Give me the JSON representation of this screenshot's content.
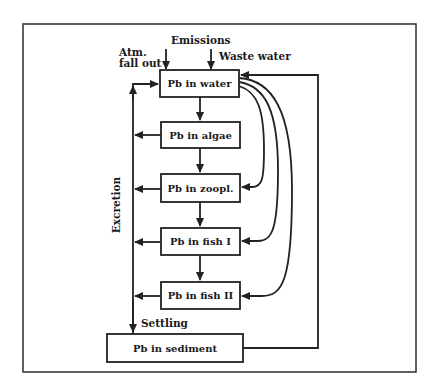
{
  "diagram": {
    "title": "",
    "nodes": {
      "water": "Pb in water",
      "algae": "Pb in algae",
      "zoopl": "Pb in zoopl.",
      "fish1": "Pb in fish I",
      "fish2": "Pb in fish II",
      "sediment": "Pb in sediment"
    },
    "inputs": {
      "emissions": "Emissions",
      "atm_line1": "Atm.",
      "atm_line2": "fall out",
      "waste_water": "Waste water"
    },
    "edge_labels": {
      "excretion": "Excretion",
      "settling": "Settling"
    },
    "edges": [
      {
        "from": "atmospheric fall out",
        "to": "water"
      },
      {
        "from": "waste water",
        "to": "water"
      },
      {
        "from": "water",
        "to": "algae"
      },
      {
        "from": "algae",
        "to": "zoopl"
      },
      {
        "from": "zoopl",
        "to": "fish1"
      },
      {
        "from": "fish1",
        "to": "fish2"
      },
      {
        "from": "water",
        "to": "zoopl"
      },
      {
        "from": "water",
        "to": "fish1"
      },
      {
        "from": "water",
        "to": "fish2"
      },
      {
        "from": "algae",
        "to": "excretion line"
      },
      {
        "from": "zoopl",
        "to": "excretion line"
      },
      {
        "from": "fish1",
        "to": "excretion line"
      },
      {
        "from": "fish2",
        "to": "excretion line"
      },
      {
        "from": "excretion line",
        "to": "water",
        "label": "Excretion"
      },
      {
        "from": "excretion line",
        "to": "sediment",
        "label": "Settling"
      },
      {
        "from": "sediment",
        "to": "water"
      }
    ]
  }
}
